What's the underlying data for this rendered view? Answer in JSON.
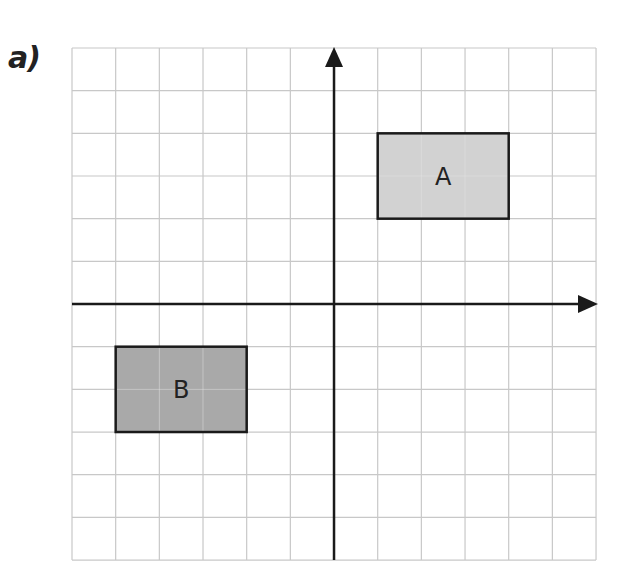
{
  "question": {
    "part_label": "a)"
  },
  "grid": {
    "cols": 12,
    "rows": 12,
    "origin_col": 6,
    "origin_row": 6,
    "left": 72,
    "top": 48,
    "cell_w": 43.67,
    "cell_h": 42.67,
    "line_color": "#c8c8c8"
  },
  "axes": {
    "color": "#1a1a1a",
    "x_arrow_tip": 598,
    "y_arrow_tip": 47,
    "y_bottom": 560
  },
  "shapes": [
    {
      "name": "A",
      "label": "A",
      "x1": 1,
      "y1": 2,
      "x2": 4,
      "y2": 4,
      "fill": "#d2d2d2"
    },
    {
      "name": "B",
      "label": "B",
      "x1": -5,
      "y1": -3,
      "x2": -2,
      "y2": -1,
      "fill": "#a9a9a9"
    }
  ]
}
